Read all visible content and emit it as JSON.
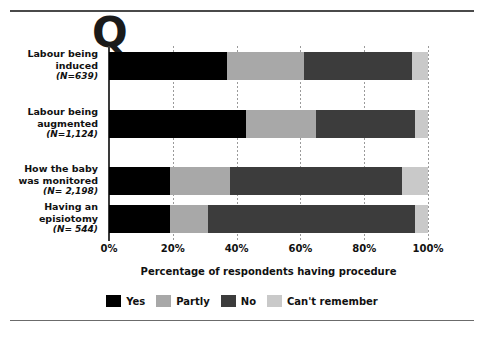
{
  "figure": {
    "question_marker": "Q",
    "x_axis_title": "Percentage of respondents having procedure"
  },
  "chart_data": {
    "type": "bar",
    "orientation": "horizontal",
    "stacked": true,
    "title": "",
    "xlabel": "Percentage of respondents having procedure",
    "ylabel": "",
    "xlim": [
      0,
      100
    ],
    "xticks": [
      "0%",
      "20%",
      "40%",
      "60%",
      "80%",
      "100%"
    ],
    "xtick_values": [
      0,
      20,
      40,
      60,
      80,
      100
    ],
    "grid": "vertical dotted gridlines",
    "legend_position": "bottom-center",
    "categories": [
      "Labour being induced",
      "Labour being augmented",
      "How the baby was monitored",
      "Having an episiotomy"
    ],
    "category_labels": [
      {
        "line1": "Labour being",
        "line2": "induced",
        "n": "(N=639)"
      },
      {
        "line1": "Labour being",
        "line2": "augmented",
        "n": "(N=1,124)"
      },
      {
        "line1": "How the baby",
        "line2": "was monitored",
        "n": "(N= 2,198)"
      },
      {
        "line1": "Having an",
        "line2": "episiotomy",
        "n": "(N= 544)"
      }
    ],
    "series": [
      {
        "name": "Yes",
        "color": "#000000",
        "values": [
          37,
          43,
          19,
          19
        ]
      },
      {
        "name": "Partly",
        "color": "#a8a8a8",
        "values": [
          24,
          22,
          19,
          12
        ]
      },
      {
        "name": "No",
        "color": "#3c3c3c",
        "values": [
          34,
          31,
          54,
          65
        ]
      },
      {
        "name": "Can't remember",
        "color": "#c9c9c9",
        "values": [
          5,
          4,
          8,
          4
        ]
      }
    ]
  }
}
